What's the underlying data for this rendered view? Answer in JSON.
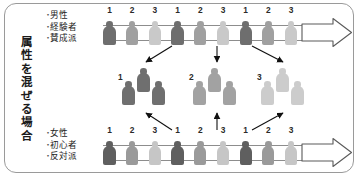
{
  "figure": {
    "vertical_caption": "属性を混ぜる場合",
    "caption_chars": [
      "属",
      "性",
      "を",
      "混",
      "ぜ",
      "る",
      "場",
      "合"
    ],
    "attribute_groups": [
      {
        "position": "top",
        "bullet": "・",
        "items": [
          "男性",
          "経験者",
          "賛成派"
        ]
      },
      {
        "position": "bottom",
        "bullet": "・",
        "items": [
          "女性",
          "初心者",
          "反対派"
        ]
      }
    ],
    "rows": [
      {
        "name": "top-row",
        "labels": [
          "1",
          "2",
          "3",
          "1",
          "2",
          "3",
          "1",
          "2",
          "3"
        ],
        "shades": [
          "#6e6e6e",
          "#a0a0a0",
          "#c9c9c9",
          "#6e6e6e",
          "#a0a0a0",
          "#c9c9c9",
          "#6e6e6e",
          "#a0a0a0",
          "#c9c9c9"
        ],
        "arrow": "block-arrow-right"
      },
      {
        "name": "bottom-row",
        "labels": [
          "1",
          "2",
          "3",
          "1",
          "2",
          "3",
          "1",
          "2",
          "3"
        ],
        "shades": [
          "#5f5f5f",
          "#9a9a9a",
          "#c6c6c6",
          "#5f5f5f",
          "#9a9a9a",
          "#c6c6c6",
          "#5f5f5f",
          "#9a9a9a",
          "#c6c6c6"
        ],
        "arrow": "block-arrow-right"
      }
    ],
    "clusters": [
      {
        "label": "1",
        "shade": "#6f6f6f",
        "members": 3
      },
      {
        "label": "2",
        "shade": "#a2a2a2",
        "members": 3
      },
      {
        "label": "3",
        "shade": "#cccccc",
        "members": 3
      }
    ],
    "connector_count": 6,
    "colors": {
      "frame": "#9a9a9a",
      "band_line": "#8d8d8d",
      "arrow_outline": "#4a4a4a",
      "text": "#1c1c1c"
    }
  }
}
